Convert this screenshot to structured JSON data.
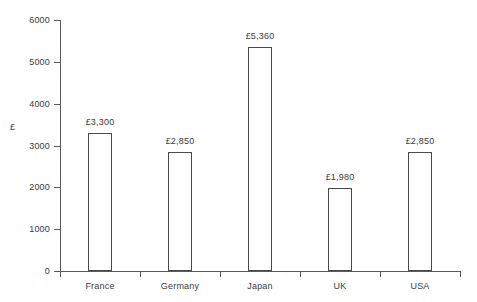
{
  "chart_data": {
    "type": "bar",
    "title": "",
    "xlabel": "",
    "ylabel": "£",
    "categories": [
      "France",
      "Germany",
      "Japan",
      "UK",
      "USA"
    ],
    "values": [
      3300,
      2850,
      5360,
      1980,
      2850
    ],
    "value_labels": [
      "£3,300",
      "£2,850",
      "£5,360",
      "£1,980",
      "£2,850"
    ],
    "ylim": [
      0,
      6000
    ],
    "ytick_values": [
      0,
      1000,
      2000,
      3000,
      4000,
      5000,
      6000
    ],
    "ytick_labels": [
      "0",
      "1000",
      "2000",
      "3000",
      "4000",
      "5000",
      "6000"
    ],
    "grid": false,
    "legend": null,
    "bar_fill": "#ffffff",
    "bar_stroke": "#4a4a4a",
    "axis_color": "#5a5a5a",
    "text_color": "#3a3a3a",
    "background": "#ffffff"
  }
}
